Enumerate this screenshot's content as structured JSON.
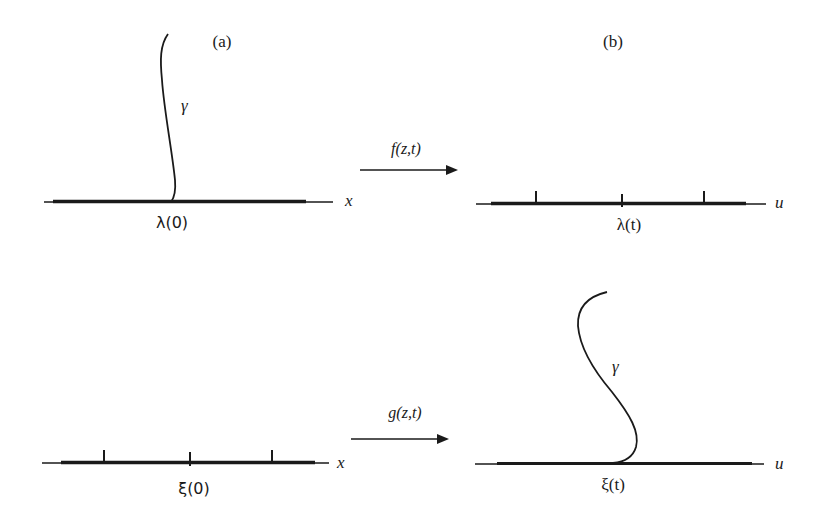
{
  "panels": {
    "a": {
      "label": "(a)"
    },
    "b": {
      "label": "(b)"
    }
  },
  "top_row": {
    "left": {
      "axis_label": "x",
      "point_label": "λ(0)",
      "curve_label": "γ",
      "ticks": 0
    },
    "arrow": {
      "label": "f(z,t)"
    },
    "right": {
      "axis_label": "u",
      "point_label": "λ(t)",
      "ticks": 3
    }
  },
  "bottom_row": {
    "left": {
      "axis_label": "x",
      "point_label": "ξ(0)",
      "ticks": 3
    },
    "arrow": {
      "label": "g(z,t)"
    },
    "right": {
      "axis_label": "u",
      "point_label": "ξ(t)",
      "curve_label": "γ",
      "ticks": 0
    }
  },
  "colors": {
    "stroke": "#1a1a1a",
    "background": "#ffffff"
  }
}
